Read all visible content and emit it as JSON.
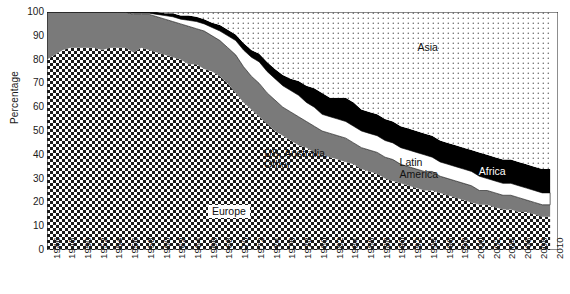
{
  "chart_data": {
    "type": "area",
    "stacked": true,
    "title": "",
    "subtitle": "",
    "xlabel": "",
    "ylabel": "Percentage",
    "ylim": [
      0,
      100
    ],
    "xlim": [
      1946,
      2011
    ],
    "ytick_step": 10,
    "yticks": [
      0,
      10,
      20,
      30,
      40,
      50,
      60,
      70,
      80,
      90,
      100
    ],
    "grid": false,
    "legend_position": "inline-annotations",
    "x": [
      1946,
      1947,
      1948,
      1949,
      1950,
      1951,
      1952,
      1953,
      1954,
      1955,
      1956,
      1957,
      1958,
      1959,
      1960,
      1961,
      1962,
      1963,
      1964,
      1965,
      1966,
      1967,
      1968,
      1969,
      1970,
      1971,
      1972,
      1973,
      1974,
      1975,
      1976,
      1977,
      1978,
      1979,
      1980,
      1981,
      1982,
      1983,
      1984,
      1985,
      1986,
      1987,
      1988,
      1989,
      1990,
      1991,
      1992,
      1993,
      1994,
      1995,
      1996,
      1997,
      1998,
      1999,
      2000,
      2001,
      2002,
      2003,
      2004,
      2005,
      2006,
      2007,
      2008,
      2009,
      2010
    ],
    "xtick_labels": [
      "1946",
      "1948",
      "1950",
      "1952",
      "1954",
      "1956",
      "1958",
      "1960",
      "1962",
      "1964",
      "1966",
      "1968",
      "1970",
      "1972",
      "1974",
      "1976",
      "1978",
      "1980",
      "1982",
      "1984",
      "1986",
      "1988",
      "1990",
      "1992",
      "1994",
      "1996",
      "1998",
      "2000",
      "2002",
      "2004",
      "2006",
      "2008",
      "2010"
    ],
    "series": [
      {
        "name": "Europe",
        "fill": "checker",
        "color": "#1a1a1a",
        "values": [
          80,
          82,
          84,
          85,
          85,
          85,
          85,
          84,
          85,
          85,
          85,
          83,
          85,
          84,
          83,
          82,
          81,
          80,
          78,
          78,
          76,
          75,
          73,
          70,
          66,
          62,
          59,
          56,
          53,
          50,
          48,
          46,
          44,
          43,
          41,
          40,
          39,
          38,
          37,
          36,
          34,
          33,
          32,
          30,
          29,
          28,
          27,
          26,
          25,
          25,
          24,
          23,
          22,
          21,
          20,
          19,
          19,
          18,
          17,
          17,
          16,
          16,
          15,
          14,
          14
        ]
      },
      {
        "name": "US, Australia, Other",
        "fill": "solid-gray",
        "color": "#7a7a7a",
        "values": [
          20,
          18,
          16,
          15,
          15,
          15,
          15,
          16,
          15,
          15,
          15,
          16,
          14,
          15,
          15,
          15,
          15,
          15,
          16,
          15,
          16,
          15,
          15,
          15,
          16,
          15,
          14,
          14,
          13,
          13,
          12,
          12,
          12,
          11,
          11,
          10,
          10,
          10,
          10,
          9,
          9,
          9,
          9,
          9,
          9,
          8,
          8,
          8,
          8,
          8,
          7,
          7,
          7,
          7,
          7,
          6,
          6,
          6,
          6,
          6,
          6,
          5,
          5,
          5,
          5
        ]
      },
      {
        "name": "Latin America",
        "fill": "white",
        "color": "#ffffff",
        "values": [
          0,
          0,
          0,
          0,
          0,
          0,
          0,
          0,
          0,
          0,
          0,
          0.5,
          0.5,
          0.5,
          1,
          1.5,
          2,
          2,
          2.5,
          3,
          3,
          3.5,
          4,
          5,
          6,
          7,
          8,
          9,
          9,
          9,
          9,
          9,
          9,
          8,
          8,
          7,
          7,
          7,
          7,
          7,
          7,
          7,
          7,
          7,
          7,
          7,
          7,
          7,
          7,
          6,
          6,
          6,
          6,
          6,
          6,
          6,
          5,
          5,
          5,
          5,
          5,
          5,
          5,
          5,
          5
        ]
      },
      {
        "name": "Africa",
        "fill": "black",
        "color": "#000000",
        "values": [
          0,
          0,
          0,
          0,
          0,
          0,
          0,
          0,
          0.5,
          1,
          1,
          1,
          1,
          1,
          1,
          1,
          1.5,
          1.5,
          2,
          2,
          2,
          2,
          2.5,
          2.5,
          2.5,
          3,
          3,
          3.5,
          4,
          4,
          4.5,
          5,
          6,
          7,
          8,
          9,
          8,
          9,
          10,
          10,
          9,
          9,
          9,
          9,
          9,
          9,
          9,
          9,
          9,
          9,
          9,
          9,
          9,
          9,
          9,
          10,
          10,
          10,
          10,
          10,
          10,
          10,
          10,
          10,
          10
        ]
      },
      {
        "name": "Asia",
        "fill": "dots",
        "color": "#6b6b6b",
        "values": [
          0,
          0,
          0,
          0,
          0,
          0,
          0,
          0,
          0,
          0,
          0,
          0,
          0,
          0,
          0,
          0.5,
          0.5,
          1.5,
          1.5,
          2,
          3,
          4.5,
          5.5,
          7.5,
          9.5,
          13,
          16,
          17.5,
          21,
          24,
          26.5,
          28,
          29,
          31,
          32,
          34,
          36,
          36,
          36,
          38,
          41,
          42,
          43,
          45,
          46,
          48,
          49,
          50,
          51,
          52,
          54,
          55,
          56,
          57,
          58,
          59,
          60,
          61,
          62,
          62,
          63,
          64,
          65,
          66,
          67
        ]
      }
    ],
    "annotations": [
      {
        "name": "asia-label",
        "text": "Asia",
        "x_pct": 72.5,
        "y_pct": 12.5,
        "style": "plain"
      },
      {
        "name": "us-australia-label",
        "text": "US, Australia,\nOther",
        "x_pct": 42.5,
        "y_pct": 57.0,
        "style": "plain"
      },
      {
        "name": "latin-america-label",
        "text": "Latin\nAmerica",
        "x_pct": 69.0,
        "y_pct": 61.0,
        "style": "plain"
      },
      {
        "name": "africa-label",
        "text": "Africa",
        "x_pct": 84.5,
        "y_pct": 64.5,
        "style": "onblack"
      },
      {
        "name": "europe-label",
        "text": "Europe",
        "x_pct": 31.5,
        "y_pct": 81.0,
        "style": "boxed"
      }
    ]
  }
}
